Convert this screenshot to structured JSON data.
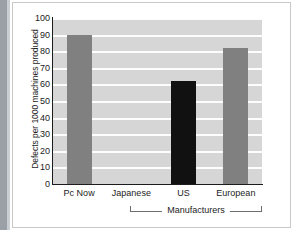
{
  "chart_data": {
    "type": "bar",
    "title": "",
    "categories": [
      "Pc Now",
      "Japanese",
      "US",
      "European"
    ],
    "values": [
      90,
      0,
      62,
      82
    ],
    "series": [
      {
        "name": "Defects per 1000 machines produced",
        "values": [
          90,
          0,
          62,
          82
        ]
      }
    ],
    "xlabel": "Manufacturers",
    "ylabel": "Defects per 1000 machines produced",
    "ylim": [
      0,
      100
    ],
    "ytick_labels": [
      "100",
      "90",
      "80",
      "70",
      "60",
      "50",
      "40",
      "30",
      "20",
      "10",
      "0"
    ],
    "ytick_values": [
      100,
      90,
      80,
      70,
      60,
      50,
      40,
      30,
      20,
      10,
      0
    ],
    "grid": true,
    "legend": false,
    "bar_colors": [
      "#808080",
      "#d6d6d6",
      "#111111",
      "#808080"
    ],
    "plot_background": "#d6d6d6",
    "gridline_color": "#fdfdfd",
    "axis_color": "#1c1c1c",
    "group_bracket": {
      "label": "Manufacturers",
      "spans": [
        "Japanese",
        "US",
        "European"
      ]
    }
  }
}
